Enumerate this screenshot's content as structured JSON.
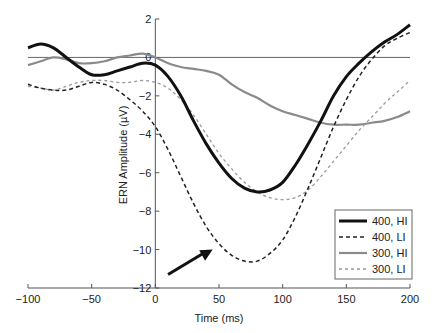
{
  "chart_data": {
    "type": "line",
    "title": "",
    "xlabel": "Time (ms)",
    "ylabel": "ERN Amplitude (µV)",
    "xlim": [
      -100,
      200
    ],
    "ylim": [
      -12,
      2
    ],
    "xticks": [
      -100,
      -50,
      0,
      50,
      100,
      150,
      200
    ],
    "yticks": [
      2,
      0,
      -2,
      -4,
      -6,
      -8,
      -10,
      -12
    ],
    "grid": false,
    "legend_position": "lower right",
    "x": [
      -100,
      -90,
      -80,
      -70,
      -60,
      -50,
      -40,
      -30,
      -20,
      -10,
      0,
      10,
      20,
      30,
      40,
      50,
      60,
      70,
      80,
      90,
      100,
      110,
      120,
      130,
      140,
      150,
      160,
      170,
      180,
      190,
      200
    ],
    "series": [
      {
        "name": "400, HI",
        "color": "#111111",
        "style": "solid",
        "width": 3,
        "values": [
          0.5,
          0.7,
          0.5,
          0.0,
          -0.5,
          -0.9,
          -0.9,
          -0.7,
          -0.5,
          -0.3,
          -0.4,
          -1.0,
          -2.0,
          -3.3,
          -4.5,
          -5.5,
          -6.3,
          -6.8,
          -7.0,
          -6.9,
          -6.5,
          -5.6,
          -4.5,
          -3.3,
          -2.0,
          -1.0,
          -0.3,
          0.3,
          0.8,
          1.2,
          1.7
        ]
      },
      {
        "name": "400, LI",
        "color": "#222222",
        "style": "dashed",
        "width": 1.5,
        "values": [
          -1.4,
          -1.6,
          -1.7,
          -1.7,
          -1.5,
          -1.3,
          -1.4,
          -1.7,
          -2.2,
          -2.8,
          -3.6,
          -4.8,
          -6.2,
          -7.6,
          -8.8,
          -9.7,
          -10.3,
          -10.6,
          -10.6,
          -10.2,
          -9.5,
          -8.3,
          -6.8,
          -5.2,
          -3.6,
          -2.2,
          -1.0,
          -0.1,
          0.6,
          1.0,
          1.3
        ]
      },
      {
        "name": "300, HI",
        "color": "#8a8a8a",
        "style": "solid",
        "width": 2.2,
        "values": [
          -0.4,
          -0.2,
          0.0,
          -0.1,
          -0.3,
          -0.3,
          -0.2,
          0.0,
          0.1,
          0.2,
          0.0,
          -0.3,
          -0.5,
          -0.6,
          -0.7,
          -0.9,
          -1.4,
          -1.8,
          -2.1,
          -2.5,
          -2.8,
          -3.0,
          -3.2,
          -3.4,
          -3.5,
          -3.5,
          -3.5,
          -3.4,
          -3.3,
          -3.1,
          -2.8
        ]
      },
      {
        "name": "300, LI",
        "color": "#999999",
        "style": "dotted",
        "width": 1.3,
        "values": [
          -1.5,
          -1.6,
          -1.7,
          -1.5,
          -1.3,
          -1.2,
          -1.2,
          -1.3,
          -1.3,
          -1.2,
          -1.3,
          -1.6,
          -2.2,
          -3.0,
          -4.0,
          -5.0,
          -5.8,
          -6.5,
          -7.0,
          -7.3,
          -7.4,
          -7.3,
          -6.9,
          -6.2,
          -5.4,
          -4.6,
          -3.8,
          -3.1,
          -2.4,
          -1.8,
          -1.2
        ]
      }
    ],
    "annotations": [
      {
        "type": "arrow",
        "from": [
          10,
          -11.3
        ],
        "to": [
          45,
          -10.0
        ],
        "label": ""
      },
      {
        "type": "hline",
        "y": 0
      }
    ]
  }
}
